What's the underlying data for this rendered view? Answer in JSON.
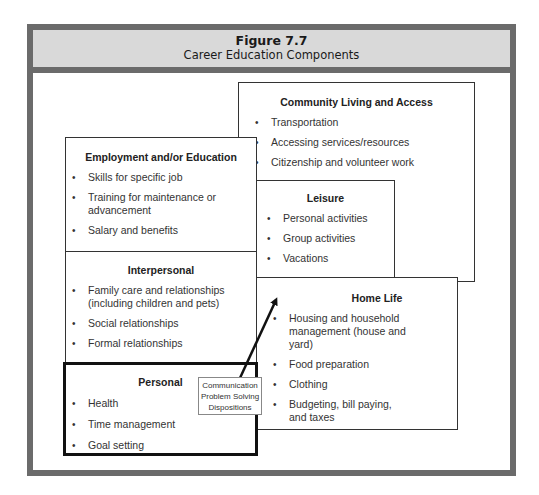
{
  "figure": {
    "number": "Figure 7.7",
    "title": "Career Education Components"
  },
  "boxes": {
    "community": {
      "title": "Community Living and Access",
      "items": [
        "Transportation",
        "Accessing services/resources",
        "Citizenship and volunteer work"
      ]
    },
    "employment": {
      "title": "Employment and/or Education",
      "items": [
        "Skills for specific job",
        "Training for maintenance or advancement",
        "Salary and benefits"
      ]
    },
    "leisure": {
      "title": "Leisure",
      "items": [
        "Personal activities",
        "Group activities",
        "Vacations"
      ]
    },
    "interpersonal": {
      "title": "Interpersonal",
      "items": [
        "Family care and relationships (including children and pets)",
        "Social relationships",
        "Formal relationships"
      ]
    },
    "homelife": {
      "title": "Home Life",
      "items": [
        "Housing and household management (house and yard)",
        "Food preparation",
        "Clothing",
        "Budgeting, bill paying, and taxes"
      ]
    },
    "personal": {
      "title": "Personal",
      "items": [
        "Health",
        "Time management",
        "Goal setting"
      ]
    }
  },
  "callout": {
    "lines": [
      "Communication",
      "Problem Solving",
      "Dispositions"
    ]
  },
  "colors": {
    "frame": "#6b6b6b",
    "header_bg": "#d9d9d9",
    "box_border": "#333333",
    "personal_border": "#111111"
  }
}
